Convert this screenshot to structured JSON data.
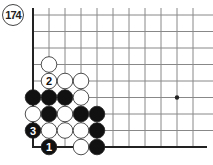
{
  "diagram": {
    "label": "174",
    "grid": {
      "cols": 11,
      "rows": 9,
      "origin_x": 33,
      "origin_y": 15,
      "spacing_x": 16,
      "spacing_y": 16.5,
      "left_edge": true,
      "bottom_edge": true,
      "star_points": [
        [
          9,
          5
        ]
      ]
    },
    "stones": [
      {
        "col": 1,
        "row": 3,
        "color": "white",
        "label": ""
      },
      {
        "col": 1,
        "row": 4,
        "color": "white",
        "label": "2"
      },
      {
        "col": 2,
        "row": 4,
        "color": "white",
        "label": ""
      },
      {
        "col": 3,
        "row": 4,
        "color": "white",
        "label": ""
      },
      {
        "col": 0,
        "row": 5,
        "color": "black",
        "label": ""
      },
      {
        "col": 1,
        "row": 5,
        "color": "black",
        "label": ""
      },
      {
        "col": 2,
        "row": 5,
        "color": "black",
        "label": ""
      },
      {
        "col": 3,
        "row": 5,
        "color": "white",
        "label": ""
      },
      {
        "col": 0,
        "row": 6,
        "color": "white",
        "label": ""
      },
      {
        "col": 1,
        "row": 6,
        "color": "black",
        "label": ""
      },
      {
        "col": 2,
        "row": 6,
        "color": "white",
        "label": ""
      },
      {
        "col": 3,
        "row": 6,
        "color": "black",
        "label": ""
      },
      {
        "col": 4,
        "row": 6,
        "color": "black",
        "label": ""
      },
      {
        "col": 0,
        "row": 7,
        "color": "black",
        "label": "3"
      },
      {
        "col": 1,
        "row": 7,
        "color": "white",
        "label": ""
      },
      {
        "col": 2,
        "row": 7,
        "color": "white",
        "label": ""
      },
      {
        "col": 3,
        "row": 7,
        "color": "white",
        "label": ""
      },
      {
        "col": 4,
        "row": 7,
        "color": "black",
        "label": ""
      },
      {
        "col": 1,
        "row": 8,
        "color": "black",
        "label": "1"
      },
      {
        "col": 3,
        "row": 8,
        "color": "white",
        "label": ""
      },
      {
        "col": 4,
        "row": 8,
        "color": "black",
        "label": ""
      }
    ],
    "colors": {
      "line": "#888888",
      "edge": "#222222",
      "black": "#111111",
      "white": "#ffffff"
    }
  }
}
